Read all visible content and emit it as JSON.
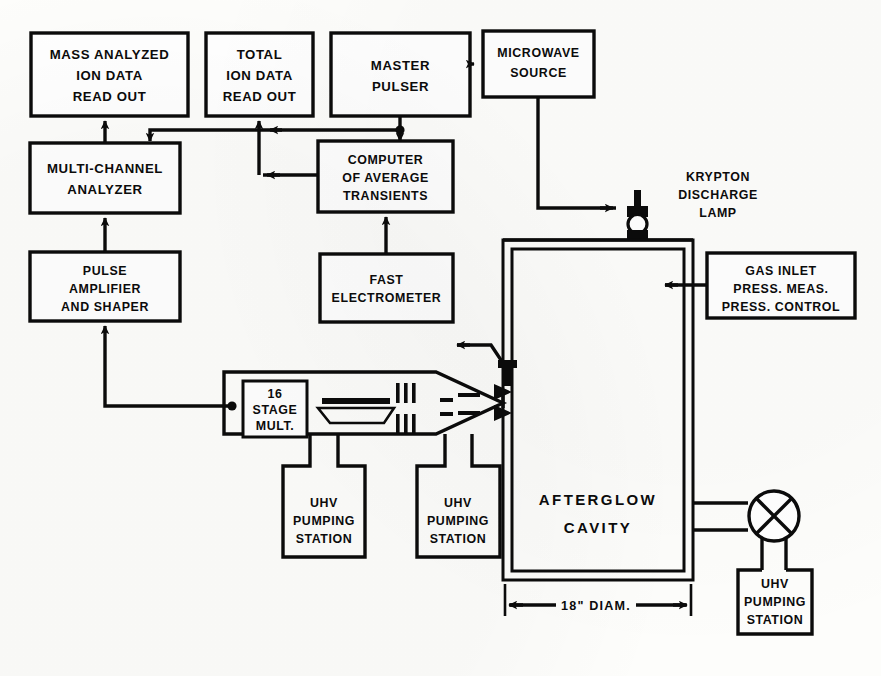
{
  "figure": {
    "kind": "apparatus-block-diagram"
  },
  "blocks": {
    "mass_analyzed_readout": {
      "lines": [
        "MASS ANALYZED",
        "ION DATA",
        "READ OUT"
      ]
    },
    "total_ion_readout": {
      "lines": [
        "TOTAL",
        "ION DATA",
        "READ OUT"
      ]
    },
    "master_pulser": {
      "lines": [
        "MASTER",
        "PULSER"
      ]
    },
    "microwave_source": {
      "lines": [
        "MICROWAVE",
        "SOURCE"
      ]
    },
    "multi_channel_analyzer": {
      "lines": [
        "MULTI-CHANNEL",
        "ANALYZER"
      ]
    },
    "computer_average_transients": {
      "lines": [
        "COMPUTER",
        "OF AVERAGE",
        "TRANSIENTS"
      ]
    },
    "pulse_amplifier": {
      "lines": [
        "PULSE",
        "AMPLIFIER",
        "AND SHAPER"
      ]
    },
    "fast_electrometer": {
      "lines": [
        "FAST",
        "ELECTROMETER"
      ]
    },
    "gas_inlet": {
      "lines": [
        "GAS INLET",
        "PRESS. MEAS.",
        "PRESS. CONTROL"
      ]
    },
    "stage_multiplier": {
      "lines": [
        "16",
        "STAGE",
        "MULT."
      ]
    },
    "uhv_pump_left": {
      "lines": [
        "UHV",
        "PUMPING",
        "STATION"
      ]
    },
    "uhv_pump_mid": {
      "lines": [
        "UHV",
        "PUMPING",
        "STATION"
      ]
    },
    "uhv_pump_right": {
      "lines": [
        "UHV",
        "PUMPING",
        "STATION"
      ]
    }
  },
  "annotations": {
    "krypton_lamp": {
      "lines": [
        "KRYPTON",
        "DISCHARGE",
        "LAMP"
      ]
    },
    "afterglow_cavity": {
      "lines": [
        "AFTERGLOW",
        "CAVITY"
      ]
    },
    "diameter_dimension": {
      "text": "18\" DIAM."
    }
  },
  "colors": {
    "ink": "#0b0b0b",
    "paper": "#fdfdfb",
    "box_fill": "#ffffff"
  }
}
